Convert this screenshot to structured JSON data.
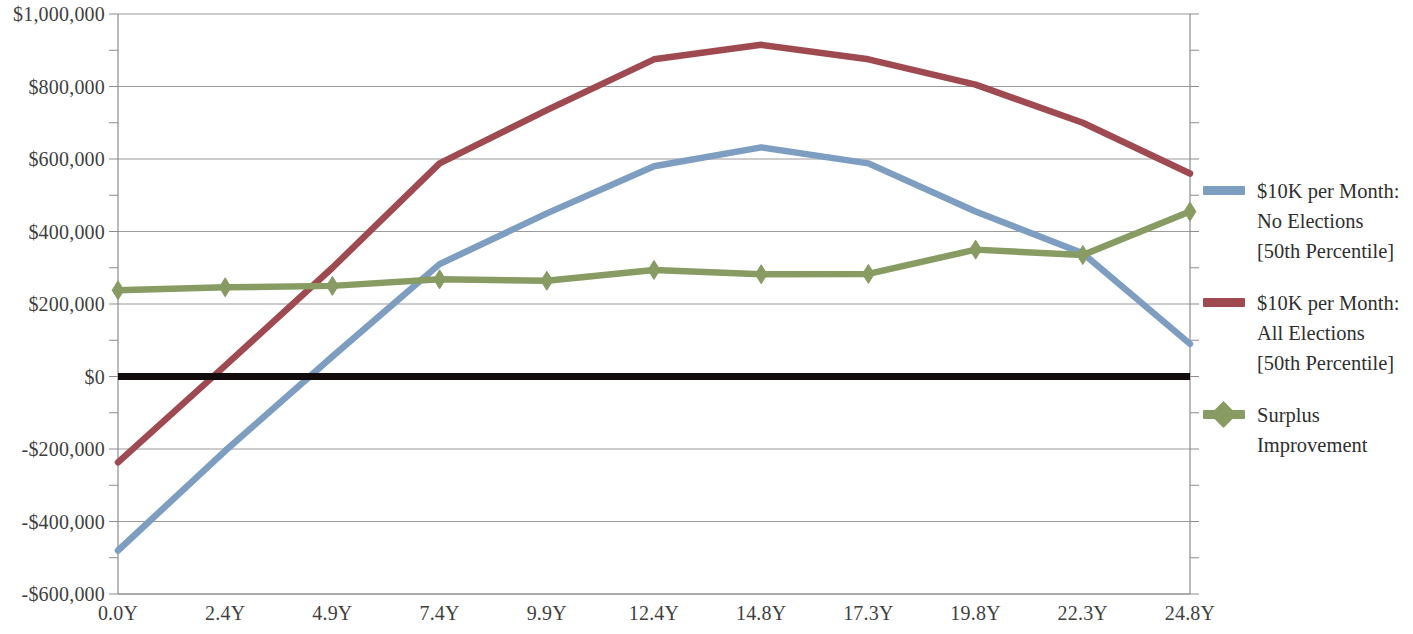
{
  "chart_data": {
    "type": "line",
    "title": "",
    "xlabel": "",
    "ylabel": "",
    "x": [
      "0.0Y",
      "2.4Y",
      "4.9Y",
      "7.4Y",
      "9.9Y",
      "12.4Y",
      "14.8Y",
      "17.3Y",
      "19.8Y",
      "22.3Y",
      "24.8Y"
    ],
    "x_numeric": [
      0.0,
      2.4,
      4.9,
      7.4,
      9.9,
      12.4,
      14.8,
      17.3,
      19.8,
      22.3,
      24.8
    ],
    "ylim": [
      -600000,
      1000000
    ],
    "y_major_ticks": [
      -600000,
      -400000,
      -200000,
      0,
      200000,
      400000,
      600000,
      800000,
      1000000
    ],
    "y_tick_labels": [
      "-$600,000",
      "-$400,000",
      "-$200,000",
      "$0",
      "$200,000",
      "$400,000",
      "$600,000",
      "$800,000",
      "$1,000,000"
    ],
    "y_minor_tick_interval": 100000,
    "grid": true,
    "grid_axis": "y",
    "zero_line": true,
    "legend_position": "right",
    "series": [
      {
        "name": "$10K per Month:\nNo Elections\n[50th Percentile]",
        "color": "#7d9ec0",
        "marker": "none",
        "values": [
          -480000,
          -205000,
          55000,
          310000,
          450000,
          580000,
          632000,
          588000,
          455000,
          340000,
          90000
        ]
      },
      {
        "name": "$10K per Month:\nAll Elections\n[50th Percentile]",
        "color": "#9e4a50",
        "marker": "none",
        "values": [
          -237000,
          30000,
          300000,
          588000,
          735000,
          875000,
          915000,
          875000,
          805000,
          700000,
          560000
        ]
      },
      {
        "name": "Surplus\nImprovement",
        "color": "#879b62",
        "marker": "diamond",
        "values": [
          238000,
          246000,
          250000,
          268000,
          264000,
          294000,
          282000,
          283000,
          350000,
          335000,
          455000
        ]
      }
    ]
  },
  "legend": {
    "entries": [
      {
        "label": "$10K per Month:\nNo Elections\n[50th Percentile]",
        "color": "#7d9ec0",
        "marker": "line"
      },
      {
        "label": "$10K per Month:\nAll Elections\n[50th Percentile]",
        "color": "#9e4a50",
        "marker": "line"
      },
      {
        "label": "Surplus\nImprovement",
        "color": "#879b62",
        "marker": "diamond"
      }
    ]
  },
  "colors": {
    "series_blue": "#7d9ec0",
    "series_red": "#9e4a50",
    "series_green": "#879b62",
    "grid": "#9a9a9a",
    "axis": "#8c8c8c",
    "zero_line": "#120c0c",
    "text": "#3f3f3f",
    "background": "#ffffff"
  }
}
